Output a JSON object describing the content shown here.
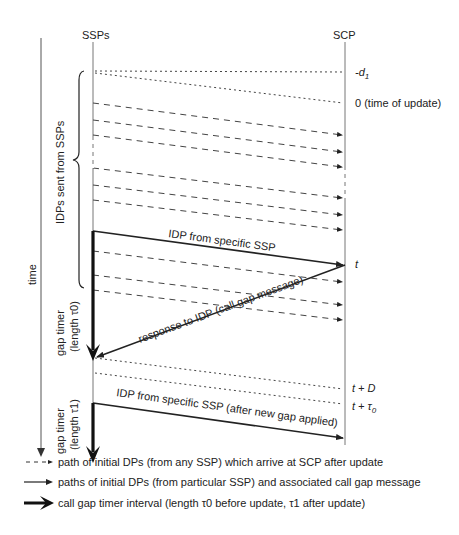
{
  "diagram": {
    "type": "sequence-timing",
    "lanes": {
      "left": "SSPs",
      "right": "SCP"
    },
    "time_axis_label": "time",
    "brace_label": "IDPs sent from SSPs",
    "gap_timer_0": {
      "line1": "gap timer",
      "line2": "(length τ0)"
    },
    "gap_timer_1": {
      "line1": "gap timer",
      "line2": "(length τ1)"
    },
    "scp_marks": [
      {
        "id": "minus-d1",
        "text": "-d",
        "sub": "1"
      },
      {
        "id": "zero",
        "text": "0 (time of update)"
      },
      {
        "id": "t",
        "text": "t"
      },
      {
        "id": "t-plus-D",
        "text": "t + D"
      },
      {
        "id": "t-plus-tau0",
        "text": "t + τ",
        "sub": "0"
      }
    ],
    "messages": {
      "idp_specific": "IDP from specific SSP",
      "response": "response to IDP (call gap message)",
      "idp_after": "IDP from specific SSP (after new gap applied)"
    },
    "legend": [
      {
        "style": "dashed",
        "text": "path of initial DPs (from any SSP) which arrive at SCP after update"
      },
      {
        "style": "solid",
        "text": "paths of initial DPs (from particular SSP) and associated call gap message"
      },
      {
        "style": "thick",
        "text": "call gap timer interval (length τ0 before update, τ1 after update)"
      }
    ],
    "colors": {
      "line": "#222222",
      "axis": "#777777",
      "dashed": "#555555"
    }
  }
}
